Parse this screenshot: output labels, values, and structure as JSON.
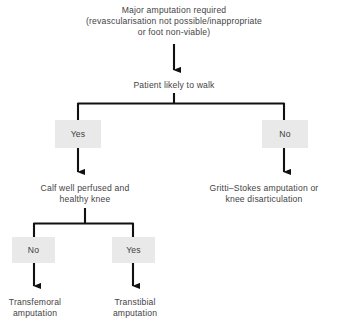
{
  "diagram": {
    "colors": {
      "box_fill": "#e9e9e9",
      "line": "#1a1a1a",
      "text": "#444444",
      "background": "#ffffff"
    },
    "nodes": {
      "root": "Major amputation required\n(revascularisation not possible/inappropriate\nor foot non-viable)",
      "patient_walk": "Patient likely to walk",
      "yes_walk": "Yes",
      "no_walk": "No",
      "calf": "Calf well perfused and\nhealthy knee",
      "gritti": "Gritti–Stokes amputation or\nknee disarticulation",
      "no_calf": "No",
      "yes_calf": "Yes",
      "transfemoral": "Transfemoral\namputation",
      "transtibial": "Transtibial\namputation"
    }
  }
}
